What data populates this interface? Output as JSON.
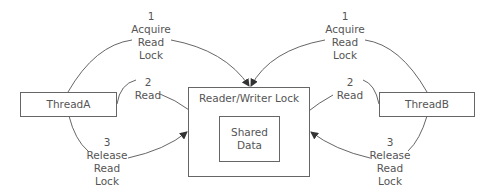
{
  "diagram": {
    "thread_a": {
      "label": "ThreadA"
    },
    "thread_b": {
      "label": "ThreadB"
    },
    "lock": {
      "label": "Reader/Writer Lock"
    },
    "shared": {
      "line1": "Shared",
      "line2": "Data"
    },
    "steps_left": [
      {
        "num": "1",
        "lines": [
          "Acquire",
          "Read",
          "Lock"
        ]
      },
      {
        "num": "2",
        "lines": [
          "Read"
        ]
      },
      {
        "num": "3",
        "lines": [
          "Release",
          "Read",
          "Lock"
        ]
      }
    ],
    "steps_right": [
      {
        "num": "1",
        "lines": [
          "Acquire",
          "Read",
          "Lock"
        ]
      },
      {
        "num": "2",
        "lines": [
          "Read"
        ]
      },
      {
        "num": "3",
        "lines": [
          "Release",
          "Read",
          "Lock"
        ]
      }
    ],
    "colors": {
      "line": "#555555",
      "text": "#555555",
      "background": "#ffffff"
    }
  }
}
